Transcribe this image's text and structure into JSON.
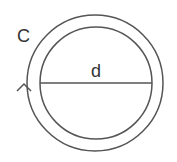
{
  "diagram": {
    "labels": {
      "circumference": "C",
      "diameter": "d"
    },
    "shapes": {
      "outer_circle": {
        "cx": 95,
        "cy": 83,
        "r": 68
      },
      "inner_circle": {
        "cx": 96,
        "cy": 83,
        "r": 56
      },
      "diameter_line": {
        "x1": 40,
        "y1": 83,
        "x2": 152,
        "y2": 83
      },
      "direction_arrow": "upward (counter-clockwise) on outer circle left side"
    },
    "colors": {
      "stroke": "#555555",
      "text": "#333333",
      "background": "#ffffff"
    }
  }
}
